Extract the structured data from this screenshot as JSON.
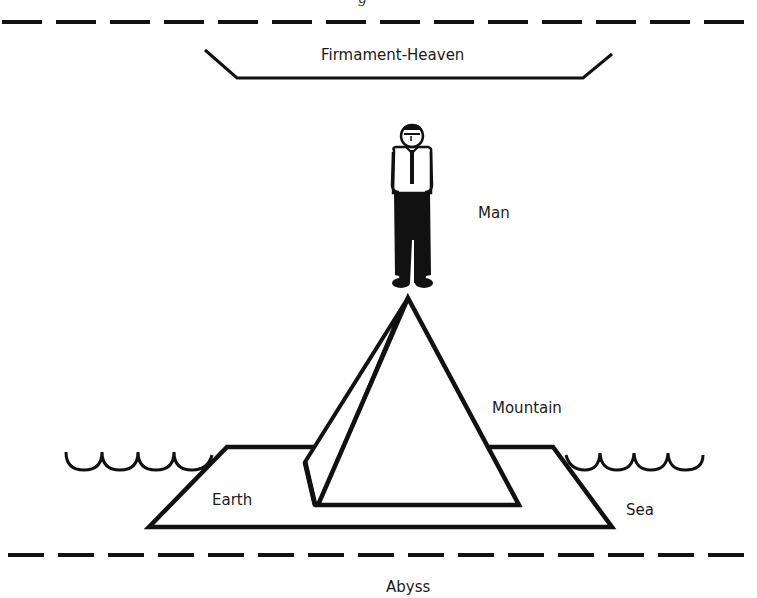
{
  "figure": {
    "type": "cosmology-diagram",
    "top_caption_partial": "g",
    "colors": {
      "ink": "#111111",
      "background": "#ffffff",
      "shirt": "#ffffff"
    }
  },
  "layers": {
    "boundary_top": {
      "style": "dashed"
    },
    "firmament": {
      "label": "Firmament-Heaven"
    },
    "man": {
      "label": "Man"
    },
    "mountain": {
      "label": "Mountain"
    },
    "earth": {
      "label": "Earth"
    },
    "sea": {
      "label": "Sea"
    },
    "boundary_bottom": {
      "style": "dashed"
    },
    "abyss": {
      "label": "Abyss"
    }
  }
}
